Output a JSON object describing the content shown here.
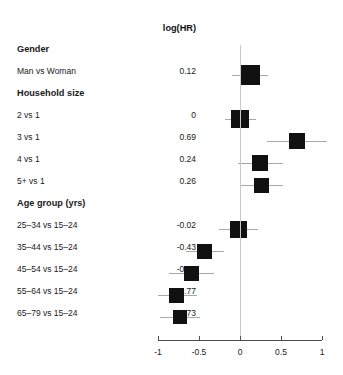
{
  "chart_data": {
    "type": "scatter",
    "title": "",
    "column_header": "log(HR)",
    "xlabel": "",
    "ylabel": "",
    "xlim": [
      -1,
      1
    ],
    "xticks": [
      -1,
      -0.5,
      0,
      0.5,
      1
    ],
    "xtick_labels": [
      "-1",
      "-0.5",
      "0",
      "0.5",
      "1"
    ],
    "grid": false,
    "reference_line": 0,
    "legend": "none",
    "groups": [
      {
        "name": "Gender",
        "rows": [
          {
            "label": "Man vs Woman",
            "value": "0.12",
            "estimate": 0.12,
            "ci_low": -0.1,
            "ci_high": 0.34,
            "box_size": 20
          }
        ]
      },
      {
        "name": "Household size",
        "rows": [
          {
            "label": "2 vs 1",
            "value": "0",
            "estimate": 0.0,
            "ci_low": -0.18,
            "ci_high": 0.2,
            "box_size": 18
          },
          {
            "label": "3 vs 1",
            "value": "0.69",
            "estimate": 0.69,
            "ci_low": 0.33,
            "ci_high": 1.06,
            "box_size": 16
          },
          {
            "label": "4 vs 1",
            "value": "0.24",
            "estimate": 0.24,
            "ci_low": -0.03,
            "ci_high": 0.52,
            "box_size": 16
          },
          {
            "label": "5+ vs 1",
            "value": "0.26",
            "estimate": 0.26,
            "ci_low": 0.0,
            "ci_high": 0.52,
            "box_size": 15
          }
        ]
      },
      {
        "name": "Age group (yrs)",
        "rows": [
          {
            "label": "25–34 vs 15–24",
            "value": "-0.02",
            "estimate": -0.02,
            "ci_low": -0.26,
            "ci_high": 0.22,
            "box_size": 17
          },
          {
            "label": "35–44 vs 15–24",
            "value": "-0.43",
            "estimate": -0.43,
            "ci_low": -0.66,
            "ci_high": -0.2,
            "box_size": 15
          },
          {
            "label": "45–54 vs 15–24",
            "value": "-0.59",
            "estimate": -0.59,
            "ci_low": -0.87,
            "ci_high": -0.32,
            "box_size": 15
          },
          {
            "label": "55–64 vs 15–24",
            "value": "-0.77",
            "estimate": -0.77,
            "ci_low": -1.0,
            "ci_high": -0.52,
            "box_size": 15
          },
          {
            "label": "65–79 vs 15–24",
            "value": "-0.73",
            "estimate": -0.73,
            "ci_low": -0.97,
            "ci_high": -0.49,
            "box_size": 14
          }
        ]
      }
    ],
    "colors": {
      "box": "#111111",
      "whisker": "#a8a8a8",
      "reference_line": "#c9c9c9",
      "axis": "#4d4d4d",
      "text": "#1a1a1a",
      "background": "#ffffff"
    }
  }
}
